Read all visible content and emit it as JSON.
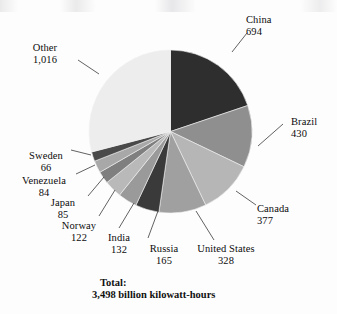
{
  "chart_data": {
    "type": "pie",
    "title": "",
    "unit": "billion kilowatt-hours",
    "total_label": "Total:",
    "total_text": "3,498 billion kilowatt-hours",
    "total_value": 3498,
    "categories": [
      "China",
      "Brazil",
      "Canada",
      "United States",
      "Russia",
      "India",
      "Norway",
      "Japan",
      "Venezuela",
      "Sweden",
      "Other"
    ],
    "values": [
      694,
      430,
      377,
      328,
      165,
      132,
      122,
      85,
      84,
      66,
      1016
    ],
    "value_labels": [
      "694",
      "430",
      "377",
      "328",
      "165",
      "132",
      "122",
      "85",
      "84",
      "66",
      "1,016"
    ],
    "colors": [
      "#2e2e2e",
      "#8f8f8f",
      "#b6b6b6",
      "#a0a0a0",
      "#3a3a3a",
      "#9a9a9a",
      "#b9b9b9",
      "#7f7f7f",
      "#a8a8a8",
      "#4a4a4a",
      "#ededed"
    ],
    "start_angle_deg": 0,
    "direction": "clockwise",
    "legend": "none",
    "labels_position": "outside-with-leader-lines"
  },
  "slices": [
    {
      "name": "China",
      "value_label": "694",
      "label_x": 246,
      "label_y": 14,
      "align": "left"
    },
    {
      "name": "Brazil",
      "value_label": "430",
      "label_x": 291,
      "label_y": 116,
      "align": "left"
    },
    {
      "name": "Canada",
      "value_label": "377",
      "label_x": 257,
      "label_y": 203,
      "align": "left"
    },
    {
      "name": "United States",
      "value_label": "328",
      "label_x": 226,
      "label_y": 253,
      "align": "center"
    },
    {
      "name": "Russia",
      "value_label": "165",
      "label_x": 164,
      "label_y": 253,
      "align": "center"
    },
    {
      "name": "India",
      "value_label": "132",
      "label_x": 120,
      "label_y": 243,
      "align": "center"
    },
    {
      "name": "Norway",
      "value_label": "122",
      "label_x": 79,
      "label_y": 232,
      "align": "center"
    },
    {
      "name": "Japan",
      "value_label": "85",
      "label_x": 62,
      "label_y": 208,
      "align": "center"
    },
    {
      "name": "Venezuela",
      "value_label": "84",
      "label_x": 40,
      "label_y": 184,
      "align": "center"
    },
    {
      "name": "Sweden",
      "value_label": "66",
      "label_x": 40,
      "label_y": 158,
      "align": "center"
    },
    {
      "name": "Other",
      "value_label": "1,016",
      "label_x": 40,
      "label_y": 48,
      "align": "center"
    }
  ]
}
